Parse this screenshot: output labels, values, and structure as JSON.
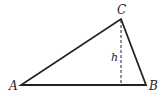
{
  "figure": {
    "type": "triangle",
    "vertices": {
      "A": {
        "label": "A",
        "x": 21,
        "y": 85
      },
      "B": {
        "label": "B",
        "x": 146,
        "y": 85
      },
      "C": {
        "label": "C",
        "x": 121,
        "y": 19
      }
    },
    "altitude": {
      "label": "h",
      "from": "C",
      "to_base": "AB",
      "style": "dashed"
    },
    "colors": {
      "stroke": "#222222",
      "background": "#ffffff"
    }
  }
}
